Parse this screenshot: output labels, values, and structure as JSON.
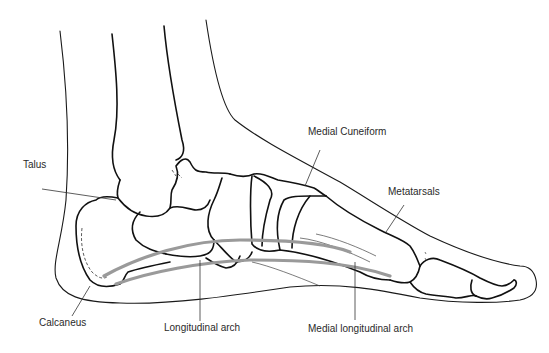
{
  "diagram": {
    "colors": {
      "line": "#111111",
      "arch_highlight": "#9a9a9a",
      "label_text": "#2a2a2a",
      "background": "#ffffff"
    },
    "labels": {
      "talus": "Talus",
      "medial_cuneiform": "Medial Cuneiform",
      "metatarsals": "Metatarsals",
      "calcaneus": "Calcaneus",
      "longitudinal_arch": "Longitudinal arch",
      "medial_longitudinal_arch": "Medial longitudinal arch"
    }
  }
}
